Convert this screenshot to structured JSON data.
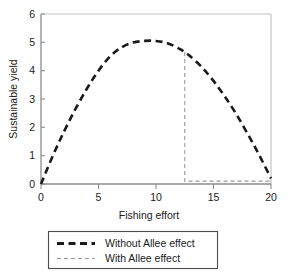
{
  "chart_data": {
    "type": "line",
    "title": "",
    "xlabel": "Fishing effort",
    "ylabel": "Sustainable yield",
    "xlim": [
      0,
      20
    ],
    "ylim": [
      0,
      6
    ],
    "xticks": [
      0,
      5,
      10,
      15,
      20
    ],
    "yticks": [
      0,
      1,
      2,
      3,
      4,
      5,
      6
    ],
    "xtick_labels": [
      "0",
      "5",
      "10",
      "15",
      "20"
    ],
    "ytick_labels": [
      "0",
      "1",
      "2",
      "3",
      "4",
      "5",
      "6"
    ],
    "grid": false,
    "legend_position": "below-plot",
    "series": [
      {
        "name": "Without Allee effect",
        "style": "dashed-thick",
        "color": "#1a1a1a",
        "x": [
          0,
          1,
          2,
          3,
          4,
          5,
          6,
          7,
          8,
          9,
          10,
          11,
          12,
          12.5,
          13,
          14,
          15,
          16,
          17,
          18,
          19,
          20
        ],
        "y": [
          0.0,
          0.97,
          1.85,
          2.65,
          3.37,
          4.0,
          4.5,
          4.82,
          4.99,
          5.05,
          5.05,
          4.97,
          4.78,
          4.66,
          4.5,
          4.12,
          3.64,
          3.08,
          2.45,
          1.75,
          1.0,
          0.2
        ]
      },
      {
        "name": "With Allee effect",
        "style": "dashed-thin",
        "color": "#9a9a9a",
        "x": [
          12.5,
          12.5,
          13,
          14,
          15,
          16,
          17,
          18,
          19,
          20
        ],
        "y": [
          4.66,
          0.1,
          0.1,
          0.1,
          0.1,
          0.1,
          0.1,
          0.1,
          0.1,
          0.1
        ],
        "note": "vertical collapse at effort 12.5 then flat near-zero yield"
      }
    ],
    "legend_entries": [
      {
        "label": "Without Allee effect",
        "style": "dashed-thick",
        "color": "#1a1a1a"
      },
      {
        "label": "With Allee effect",
        "style": "dashed-thin",
        "color": "#9a9a9a"
      }
    ]
  },
  "colors": {
    "axis": "#8c8c8c",
    "frame": "#bdbdbd",
    "primary_series": "#1a1a1a",
    "secondary_series": "#9a9a9a",
    "text": "#1a1a1a",
    "background": "#ffffff"
  }
}
